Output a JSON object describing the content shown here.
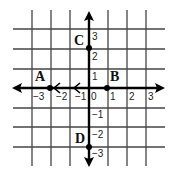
{
  "diagram": {
    "type": "coordinate-grid",
    "x_ticks": [
      "−3",
      "−2",
      "−1",
      "0",
      "1",
      "2",
      "3"
    ],
    "y_ticks": [
      "3",
      "2",
      "1",
      "−1",
      "−2",
      "−3"
    ],
    "points": [
      {
        "label": "A",
        "x": -2,
        "y": 0
      },
      {
        "label": "B",
        "x": 1,
        "y": 0
      },
      {
        "label": "C",
        "x": 0,
        "y": 2
      },
      {
        "label": "D",
        "x": 0,
        "y": -3
      }
    ],
    "colors": {
      "grid": "#333333",
      "axis": "#000000",
      "background": "#ffffff"
    }
  }
}
